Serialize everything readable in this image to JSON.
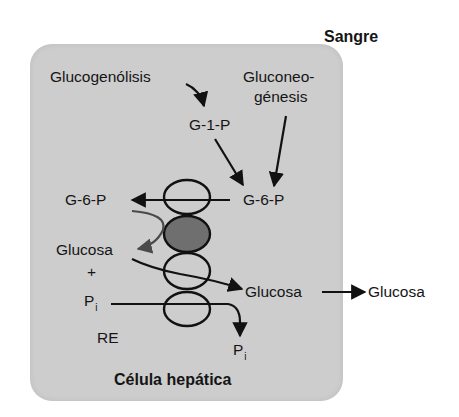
{
  "diagram": {
    "title_outside": "Sangre",
    "cell_label": "Célula hepática",
    "compartment_label": "RE",
    "colors": {
      "background": "#ffffff",
      "cell_fill": "#cdcdcd",
      "transporter_outline": "#111111",
      "enzyme_fill": "#6f6f6f",
      "arrow": "#111111",
      "grey_arrow": "#4a4a4a"
    },
    "nodes": {
      "glucogenolisis": "Glucogenólisis",
      "gluconeo_line1": "Gluconeo-",
      "gluconeo_line2": "génesis",
      "g1p": "G-1-P",
      "g6p_cytosol": "G-6-P",
      "g6p_re": "G-6-P",
      "glucosa_re": "Glucosa",
      "plus": "+",
      "pi_re": "P",
      "pi_re_sub": "i",
      "pi_cytosol": "P",
      "pi_cytosol_sub": "i",
      "glucosa_cytosol": "Glucosa",
      "glucosa_blood": "Glucosa"
    },
    "edges": [
      {
        "from": "Glucogenólisis",
        "to": "G-1-P"
      },
      {
        "from": "G-1-P",
        "to": "G-6-P"
      },
      {
        "from": "Gluconeogénesis",
        "to": "G-6-P"
      },
      {
        "from": "G-6-P (citosol)",
        "to": "G-6-P (RE)"
      },
      {
        "from": "G-6-P (RE)",
        "to": "Glucosa (RE)"
      },
      {
        "from": "Glucosa (RE)",
        "to": "Glucosa (citosol)"
      },
      {
        "from": "Pi (RE)",
        "to": "Pi (citosol)"
      },
      {
        "from": "Glucosa (citosol)",
        "to": "Glucosa (sangre)"
      }
    ],
    "membrane_proteins": [
      {
        "name": "G-6-P transporter",
        "filled": false
      },
      {
        "name": "glucosa-6-fosfatasa",
        "filled": true
      },
      {
        "name": "glucose transporter",
        "filled": false
      },
      {
        "name": "Pi transporter",
        "filled": false
      }
    ]
  }
}
